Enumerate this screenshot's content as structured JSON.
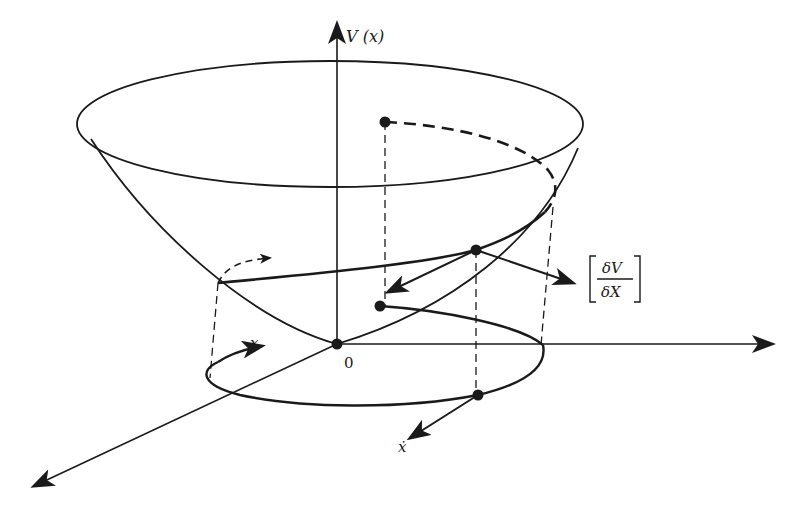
{
  "figure": {
    "colors": {
      "ink": "#1a1a1a",
      "background": "#ffffff"
    }
  },
  "labels": {
    "v_axis": "V (x)",
    "origin": "0",
    "x_state": "x",
    "x_dot": "ẋ",
    "gradient_numerator": "δV",
    "gradient_denominator": "δX"
  }
}
